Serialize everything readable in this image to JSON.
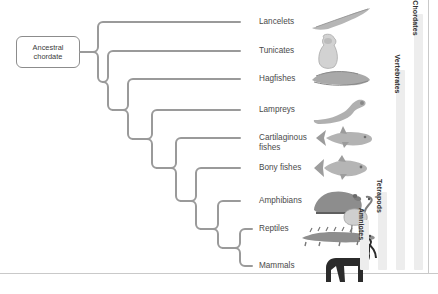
{
  "figure": {
    "root": {
      "label_line1": "Ancestral",
      "label_line2": "chordate",
      "name": "ancestral-chordate"
    },
    "line_color": "#9a9a9a",
    "text_color": "#4a4a4a",
    "bar_color": "#ededed",
    "bar_text_color": "#2f2f2f",
    "background": "#ffffff"
  },
  "tips": [
    {
      "id": "lancelets",
      "label": "Lancelets",
      "y": 22,
      "icon": "lancelet-illustration"
    },
    {
      "id": "tunicates",
      "label": "Tunicates",
      "y": 51,
      "icon": "tunicate-illustration"
    },
    {
      "id": "hagfishes",
      "label": "Hagfishes",
      "y": 79,
      "icon": "hagfish-illustration"
    },
    {
      "id": "lampreys",
      "label": "Lampreys",
      "y": 110,
      "icon": "lamprey-illustration"
    },
    {
      "id": "cartilaginous-fishes",
      "label": "Cartilaginous\nfishes",
      "y": 138,
      "icon": "shark-illustration"
    },
    {
      "id": "bony-fishes",
      "label": "Bony fishes",
      "y": 168,
      "icon": "bony-fish-illustration"
    },
    {
      "id": "amphibians",
      "label": "Amphibians",
      "y": 201,
      "icon": "frog-illustration"
    },
    {
      "id": "reptiles",
      "label": "Reptiles",
      "y": 229,
      "icon": "bird-crocodile-illustration"
    },
    {
      "id": "mammals",
      "label": "Mammals",
      "y": 266,
      "icon": "horse-illustration"
    }
  ],
  "clades": [
    {
      "id": "chordates",
      "label": "Chordates",
      "top": 14,
      "height": 256,
      "left": 414
    },
    {
      "id": "vertebrates",
      "label": "Vertebrates",
      "top": 70,
      "height": 200,
      "left": 396
    },
    {
      "id": "tetrapods",
      "label": "Tetrapods",
      "top": 192,
      "height": 78,
      "left": 378
    },
    {
      "id": "amniotes",
      "label": "Amniotes",
      "top": 220,
      "height": 50,
      "left": 360
    }
  ]
}
